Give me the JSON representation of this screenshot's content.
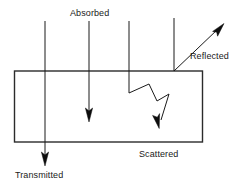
{
  "diagram": {
    "colors": {
      "background": "#ffffff",
      "line": "#1a1a1a",
      "slab_stroke": "#2b2b2b",
      "arrow_fill": "#0d0d0d",
      "label_text": "#1a1a1a"
    },
    "labels": {
      "absorbed": "Absorbed",
      "reflected": "Reflected",
      "scattered": "Scattered",
      "transmitted": "Transmitted"
    }
  }
}
